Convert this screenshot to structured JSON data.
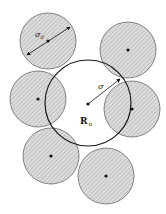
{
  "diagram": {
    "background": "#ffffff",
    "stroke": "#222222",
    "small_fill": "#d6d6d6",
    "central_circle": {
      "cx": 88,
      "cy": 103,
      "r": 43
    },
    "center_point": {
      "cx": 88,
      "cy": 104
    },
    "small_circles": [
      {
        "cx": 48,
        "cy": 41,
        "r": 28
      },
      {
        "cx": 128,
        "cy": 50,
        "r": 28
      },
      {
        "cx": 38,
        "cy": 99,
        "r": 28
      },
      {
        "cx": 132,
        "cy": 109,
        "r": 28
      },
      {
        "cx": 51,
        "cy": 156,
        "r": 28
      },
      {
        "cx": 106,
        "cy": 176,
        "r": 28
      }
    ],
    "labels": {
      "diameter_symbol": "σ",
      "diameter_subscript": "d",
      "radius_symbol": "σ",
      "center_symbol": "R",
      "center_subscript": "o"
    }
  }
}
